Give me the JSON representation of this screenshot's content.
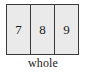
{
  "figure": {
    "type": "place-value-chart",
    "caption": "whole",
    "box": {
      "fill_color": "#eaeaea",
      "border_color": "#3a3a3a",
      "background_color": "#ffffff",
      "text_color": "#1c1c1c"
    },
    "cells": [
      {
        "digit": "7"
      },
      {
        "digit": "8"
      },
      {
        "digit": "9"
      }
    ]
  }
}
